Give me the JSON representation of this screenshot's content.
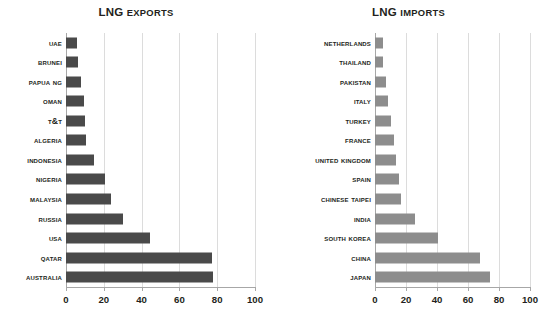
{
  "chart_data": [
    {
      "type": "bar",
      "orientation": "horizontal",
      "title": "LNG EXPORTS",
      "title_parts": {
        "lead": "LNG",
        "rest": "EXPORTS"
      },
      "xlabel": "",
      "ylabel": "",
      "xlim": [
        0,
        100
      ],
      "xticks": [
        0,
        20,
        40,
        60,
        80,
        100
      ],
      "grid": true,
      "legend": "none",
      "bar_color": "#4a4a4a",
      "categories": [
        "UAE",
        "Brunei",
        "Papua NG",
        "Oman",
        "T&T",
        "Algeria",
        "Indonesia",
        "Nigeria",
        "Malaysia",
        "Russia",
        "USA",
        "Qatar",
        "Australia"
      ],
      "values": [
        6,
        6.5,
        8,
        9.5,
        10,
        10.5,
        15,
        20.5,
        24,
        30,
        44.5,
        77,
        78
      ]
    },
    {
      "type": "bar",
      "orientation": "horizontal",
      "title": "LNG IMPORTS",
      "title_parts": {
        "lead": "LNG",
        "rest": "IMPORTS"
      },
      "xlabel": "",
      "ylabel": "",
      "xlim": [
        0,
        100
      ],
      "xticks": [
        0,
        20,
        40,
        60,
        80,
        100
      ],
      "grid": true,
      "legend": "none",
      "bar_color": "#8d8d8d",
      "categories": [
        "Netherlands",
        "Thailand",
        "Pakistan",
        "Italy",
        "Turkey",
        "France",
        "United Kingdom",
        "Spain",
        "Chinese Taipei",
        "India",
        "South Korea",
        "China",
        "Japan"
      ],
      "values": [
        5,
        5.2,
        7,
        8.5,
        10.5,
        12.5,
        13.5,
        15.5,
        17,
        26,
        40.5,
        68,
        74.5
      ]
    }
  ]
}
